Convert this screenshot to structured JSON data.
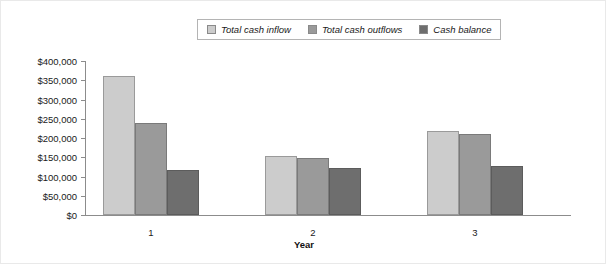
{
  "legend": {
    "position": "top-center",
    "entries": [
      {
        "label": "Total cash inflow",
        "color": "#cccccc"
      },
      {
        "label": "Total cash outflows",
        "color": "#9a9a9a"
      },
      {
        "label": "Cash balance",
        "color": "#6e6e6e"
      }
    ]
  },
  "axes": {
    "x_title": "Year",
    "y_ticks": [
      "$0",
      "$50,000",
      "$100,000",
      "$150,000",
      "$200,000",
      "$250,000",
      "$300,000",
      "$350,000",
      "$400,000"
    ],
    "x_categories": [
      "1",
      "2",
      "3"
    ]
  },
  "chart_data": {
    "type": "bar",
    "title": "",
    "xlabel": "Year",
    "ylabel": "",
    "categories": [
      "1",
      "2",
      "3"
    ],
    "series": [
      {
        "name": "Total cash inflow",
        "color": "#cccccc",
        "values": [
          360000,
          152000,
          218000
        ]
      },
      {
        "name": "Total cash outflows",
        "color": "#9a9a9a",
        "values": [
          240000,
          147000,
          210000
        ]
      },
      {
        "name": "Cash balance",
        "color": "#6e6e6e",
        "values": [
          117000,
          122000,
          128000
        ]
      }
    ],
    "ylim": [
      0,
      400000
    ],
    "ytick_step": 50000,
    "ytick_labels": [
      "$0",
      "$50,000",
      "$100,000",
      "$150,000",
      "$200,000",
      "$250,000",
      "$300,000",
      "$350,000",
      "$400,000"
    ],
    "grid": false,
    "legend_position": "top-center"
  }
}
